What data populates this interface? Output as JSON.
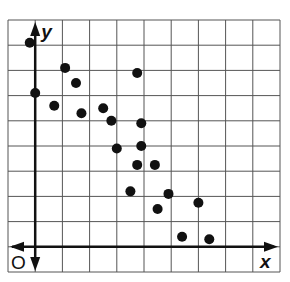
{
  "chart_data": {
    "type": "scatter",
    "title": "",
    "xlabel": "x",
    "ylabel": "y",
    "origin_label": "O",
    "grid": true,
    "tick_labels": false,
    "xlim": [
      -1,
      9
    ],
    "ylim": [
      -1,
      9
    ],
    "grid_step": 1,
    "legend": null,
    "points": [
      {
        "x": -0.2,
        "y": 8.1
      },
      {
        "x": 0.0,
        "y": 6.1
      },
      {
        "x": 0.7,
        "y": 5.6
      },
      {
        "x": 1.1,
        "y": 7.1
      },
      {
        "x": 1.5,
        "y": 6.5
      },
      {
        "x": 1.7,
        "y": 5.3
      },
      {
        "x": 2.5,
        "y": 5.5
      },
      {
        "x": 2.8,
        "y": 5.0
      },
      {
        "x": 3.75,
        "y": 6.9
      },
      {
        "x": 3.9,
        "y": 4.9
      },
      {
        "x": 3.0,
        "y": 3.9
      },
      {
        "x": 3.9,
        "y": 4.0
      },
      {
        "x": 3.75,
        "y": 3.25
      },
      {
        "x": 4.4,
        "y": 3.25
      },
      {
        "x": 3.5,
        "y": 2.2
      },
      {
        "x": 4.9,
        "y": 2.1
      },
      {
        "x": 4.5,
        "y": 1.5
      },
      {
        "x": 6.0,
        "y": 1.75
      },
      {
        "x": 5.4,
        "y": 0.4
      },
      {
        "x": 6.4,
        "y": 0.3
      }
    ]
  },
  "style": {
    "grid_color": "#555555",
    "axis_color": "#111111",
    "dot_color": "#111111",
    "background": "#ffffff"
  }
}
